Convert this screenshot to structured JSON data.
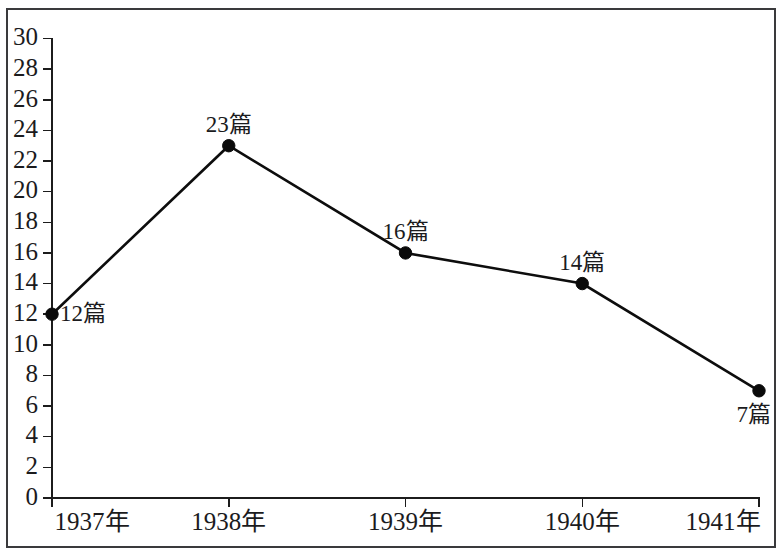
{
  "chart_data": {
    "type": "line",
    "title": "",
    "subtitle": "",
    "xlabel": "",
    "ylabel": "",
    "categories": [
      "1937年",
      "1938年",
      "1939年",
      "1940年",
      "1941年"
    ],
    "values": [
      12,
      23,
      16,
      14,
      7
    ],
    "point_labels": [
      "12篇",
      "23篇",
      "16篇",
      "14篇",
      "7篇"
    ],
    "ylim": [
      0,
      30
    ],
    "ytick_step": 2,
    "ytick_labels": [
      "0",
      "2",
      "4",
      "6",
      "8",
      "10",
      "12",
      "14",
      "16",
      "18",
      "20",
      "22",
      "24",
      "26",
      "28",
      "30"
    ],
    "grid": false,
    "legend": false,
    "legend_position": "none",
    "marker": "filled-circle",
    "line_color": "#0d0d0d",
    "marker_color": "#0a0a0a",
    "axis_color": "#1c1c1c",
    "text_color": "#1b1b1d",
    "background_color": "#ffffff",
    "frame_color": "#3a3a3c"
  },
  "annotations": {
    "label_placements": [
      {
        "label": "12篇",
        "position": "right"
      },
      {
        "label": "23篇",
        "position": "above"
      },
      {
        "label": "16篇",
        "position": "above"
      },
      {
        "label": "14篇",
        "position": "above"
      },
      {
        "label": "7篇",
        "position": "below-left"
      }
    ]
  }
}
